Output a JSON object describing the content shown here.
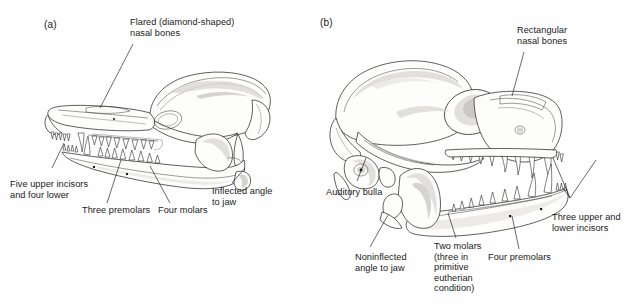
{
  "figure": {
    "panels": [
      {
        "letter": "(a)",
        "name": "marsupial-skull",
        "labels": [
          {
            "key": "flared_nasal",
            "text": "Flared (diamond-shaped)\nnasal bones"
          },
          {
            "key": "five_incisors",
            "text": "Five upper incisors\nand four lower"
          },
          {
            "key": "three_premolars",
            "text": "Three premolars"
          },
          {
            "key": "four_molars",
            "text": "Four molars"
          },
          {
            "key": "inflected_angle",
            "text": "Inflected angle\nto jaw"
          }
        ]
      },
      {
        "letter": "(b)",
        "name": "eutherian-skull",
        "labels": [
          {
            "key": "rect_nasal",
            "text": "Rectangular\nnasal bones"
          },
          {
            "key": "auditory_bulla",
            "text": "Auditory bulla"
          },
          {
            "key": "noninflected",
            "text": "Noninflected\nangle to jaw"
          },
          {
            "key": "two_molars",
            "text": "Two molars\n(three in\nprimitive\neutherian\ncondition)"
          },
          {
            "key": "four_premolars",
            "text": "Four premolars"
          },
          {
            "key": "three_incisors",
            "text": "Three upper and\nlower incisors"
          }
        ]
      }
    ],
    "colors": {
      "background": "#fefefe",
      "ink": "#1a1a1a",
      "bone_fill": "#fdfdfc",
      "shading": "#d8d6d2"
    }
  }
}
